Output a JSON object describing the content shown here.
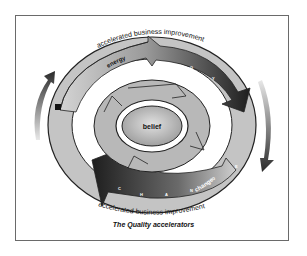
{
  "diagram": {
    "caption": "The Quality accelerators",
    "top_arc_label": "accelerated business improvement",
    "bottom_arc_label": "accelerated business improvement",
    "outer_ring": {
      "top_band_label": "energy",
      "top_band_letters": "E N E R G Y",
      "bottom_band_label": "change",
      "bottom_band_letters": "C H A N G E"
    },
    "center_label": "belief",
    "colors": {
      "frame": "#6a6a6a",
      "light_band": "#c8c8c8",
      "dark_band": "#2a2a2a",
      "mid_band": "#9a9a9a",
      "text": "#111111"
    }
  }
}
